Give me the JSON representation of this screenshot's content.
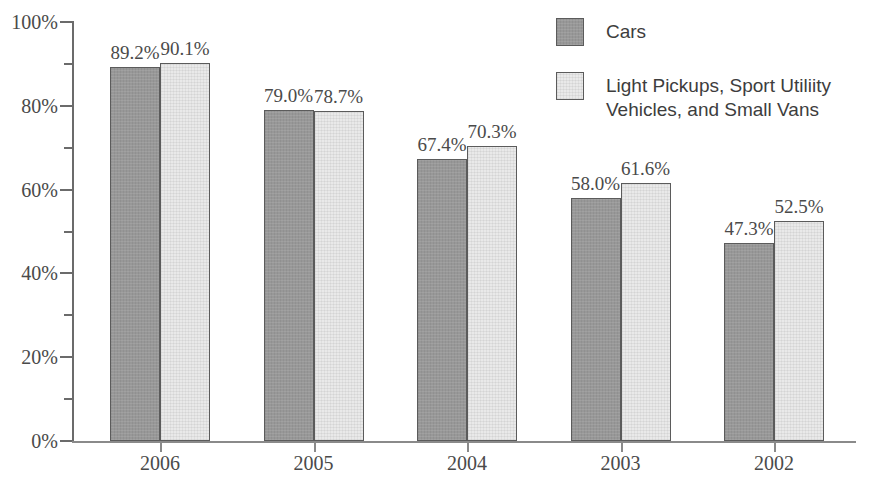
{
  "chart_data": {
    "type": "bar",
    "title": "",
    "subtitle": "",
    "xlabel": "",
    "ylabel": "",
    "categories": [
      "2006",
      "2005",
      "2004",
      "2003",
      "2002"
    ],
    "series": [
      {
        "name": "Cars",
        "key": "cars",
        "color": "#989898",
        "values": [
          89.2,
          79.0,
          67.4,
          58.0,
          47.3
        ],
        "labels": [
          "89.2%",
          "79.0%",
          "67.4%",
          "58.0%",
          "47.3%"
        ]
      },
      {
        "name": "Light Pickups, Sport Utiliity Vehicles, and Small Vans",
        "key": "light_trucks",
        "color": "#e9e9e9",
        "values": [
          90.1,
          78.7,
          70.3,
          61.6,
          52.5
        ],
        "labels": [
          "90.1%",
          "78.7%",
          "70.3%",
          "61.6%",
          "52.5%"
        ]
      }
    ],
    "ylim": [
      0,
      100
    ],
    "y_major_ticks": [
      0,
      20,
      40,
      60,
      80,
      100
    ],
    "y_minor_ticks": [
      10,
      30,
      50,
      70,
      90
    ],
    "y_tick_labels": [
      "0%",
      "20%",
      "40%",
      "60%",
      "80%",
      "100%"
    ],
    "grid": false,
    "legend_position": "top-right"
  },
  "axes": {
    "y_labels": [
      "100%",
      "80%",
      "60%",
      "40%",
      "20%",
      "0%"
    ],
    "x_labels": [
      "2006",
      "2005",
      "2004",
      "2003",
      "2002"
    ]
  },
  "legend": {
    "entries": [
      {
        "label": "Cars",
        "swatch": "dark"
      },
      {
        "label": "Light Pickups, Sport Utiliity Vehicles, and Small Vans",
        "swatch": "light"
      }
    ],
    "entry_0_label": "Cars",
    "entry_1_line_1": "Light Pickups, Sport Utiliity",
    "entry_1_line_2": "Vehicles, and Small Vans"
  }
}
